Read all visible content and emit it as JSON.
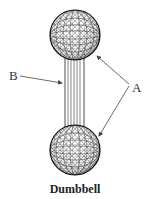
{
  "figure": {
    "caption": "Dumbbell",
    "labels": {
      "a": "A",
      "b": "B"
    },
    "parts": [
      {
        "label": "A",
        "target": "spheres (two ends)"
      },
      {
        "label": "B",
        "target": "connecting bar"
      }
    ],
    "colors": {
      "line": "#222222",
      "arrow": "#555555",
      "background": "#ffffff"
    }
  }
}
